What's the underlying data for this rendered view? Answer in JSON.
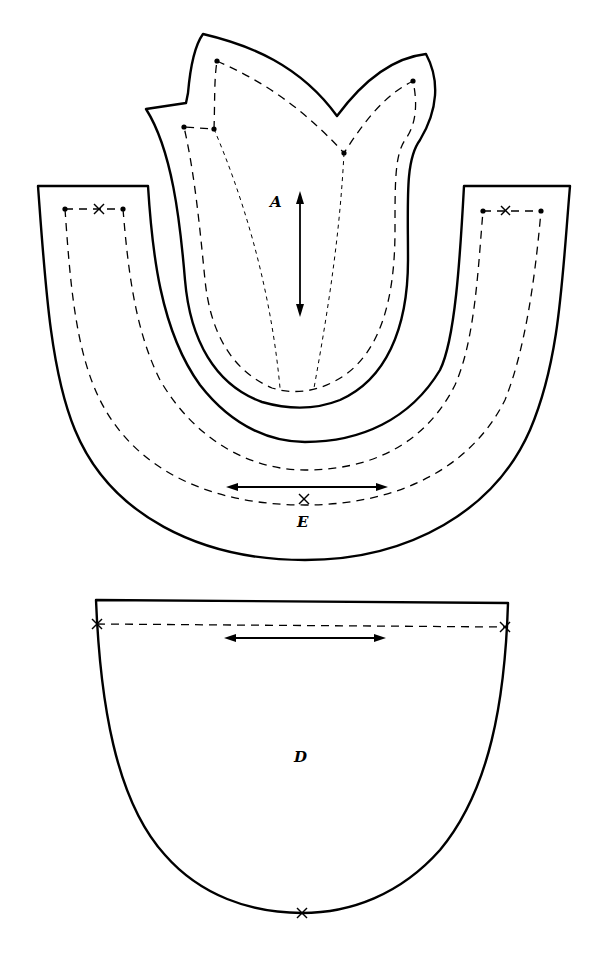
{
  "diagram": {
    "type": "sewing-pattern",
    "pieces": [
      {
        "id": "A",
        "label": "A",
        "shape": "tulip / two-petal upper piece with seam allowance",
        "markings": [
          "seam line (dashed)",
          "dart fold lines (fine dashed)",
          "vertical grain-line arrow",
          "corner dots"
        ]
      },
      {
        "id": "E",
        "label": "E",
        "shape": "U-shaped band",
        "markings": [
          "seam line (dashed)",
          "horizontal grain-line arrow",
          "center notch x",
          "end notch x marks with dots"
        ]
      },
      {
        "id": "D",
        "label": "D",
        "shape": "rounded bowl / sole piece",
        "markings": [
          "top seam line (dashed)",
          "horizontal grain-line arrow",
          "side notch x marks",
          "bottom center notch x"
        ]
      }
    ],
    "colors": {
      "background": "#ffffff",
      "line": "#000000"
    }
  }
}
